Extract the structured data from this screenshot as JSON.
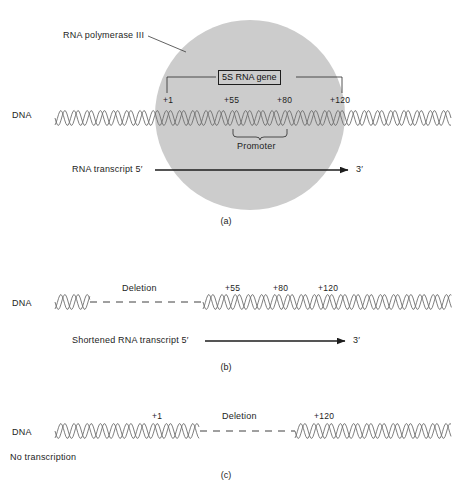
{
  "figure": {
    "background_color": "#ffffff",
    "line_color": "#3a3a3a",
    "helix_color": "#6f6f6f",
    "polymerase_color": "#cccccc",
    "text_color": "#1d1d1d"
  },
  "panel_a": {
    "caption": "(a)",
    "dna_label": "DNA",
    "polymerase_label": "RNA polymerase III",
    "gene_box_label": "5S RNA gene",
    "promoter_label": "Promoter",
    "transcript_label": "RNA transcript 5′",
    "transcript_end_label": "3′",
    "positions": [
      {
        "label": "+1",
        "x": 167
      },
      {
        "label": "+55",
        "x": 233
      },
      {
        "label": "+80",
        "x": 286
      },
      {
        "label": "+120",
        "x": 342
      }
    ]
  },
  "panel_b": {
    "caption": "(b)",
    "dna_label": "DNA",
    "deletion_label": "Deletion",
    "transcript_label": "Shortened RNA transcript 5′",
    "transcript_end_label": "3′",
    "positions": [
      {
        "label": "+55",
        "x": 233
      },
      {
        "label": "+80",
        "x": 281
      },
      {
        "label": "+120",
        "x": 329
      }
    ]
  },
  "panel_c": {
    "caption": "(c)",
    "dna_label": "DNA",
    "deletion_label": "Deletion",
    "no_transcription_label": "No transcription",
    "positions": [
      {
        "label": "+1",
        "x": 156
      },
      {
        "label": "+120",
        "x": 325
      }
    ]
  }
}
